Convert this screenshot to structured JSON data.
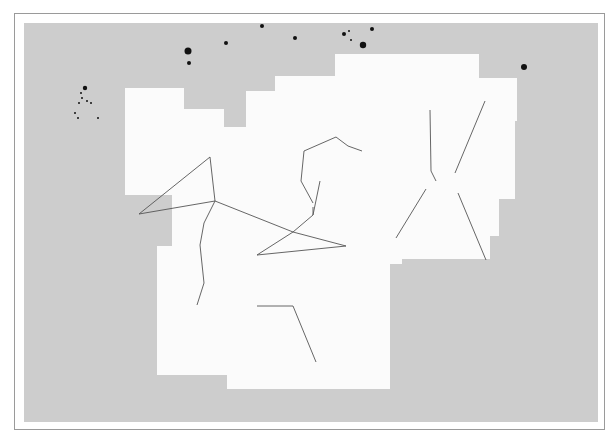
{
  "map": {
    "title": "Leo region star chart",
    "colors": {
      "outside": "#cdcdcd",
      "highlight": "#fbfbfb",
      "star": "#111111",
      "line": "#555555",
      "text": "#333333"
    },
    "constellation_labels": [
      {
        "name": "COMA BERENICES",
        "x": 16,
        "y": 52
      },
      {
        "name": "URSA MAJOR",
        "x": 131,
        "y": 52
      },
      {
        "name": "LEO MINOR",
        "x": 208,
        "y": 31
      },
      {
        "name": "GEMINI",
        "x": 538,
        "y": 67
      },
      {
        "name": "LEO",
        "x": 203,
        "y": 155
      },
      {
        "name": "CANCER",
        "x": 377,
        "y": 241
      },
      {
        "name": "VIRGO",
        "x": 51,
        "y": 252
      },
      {
        "name": "SEXTANS",
        "x": 222,
        "y": 263
      },
      {
        "name": "HYDRA",
        "x": 352,
        "y": 293
      },
      {
        "name": "CANIS MINOR",
        "x": 485,
        "y": 272
      },
      {
        "name": "MONOCEROS",
        "x": 518,
        "y": 321
      },
      {
        "name": "CRATER",
        "x": 108,
        "y": 378
      },
      {
        "name": "CANIS MAJOR",
        "x": 502,
        "y": 384
      }
    ],
    "named_objects": [
      {
        "name": "Regulus",
        "x": 302,
        "y": 209
      },
      {
        "name": "Praesepe",
        "x": 433,
        "y": 163
      },
      {
        "name": "Procyon",
        "x": 525,
        "y": 268
      },
      {
        "name": "M44",
        "x": 400,
        "y": 163
      },
      {
        "name": "M67",
        "x": 413,
        "y": 218
      },
      {
        "name": "M65",
        "x": 191,
        "y": 205
      },
      {
        "name": "M66",
        "x": 161,
        "y": 212
      },
      {
        "name": "M105",
        "x": 214,
        "y": 204
      },
      {
        "name": "M96",
        "x": 220,
        "y": 217
      },
      {
        "name": "M95",
        "x": 253,
        "y": 214
      },
      {
        "name": "R-leo",
        "label": "R",
        "x": 330,
        "y": 224
      },
      {
        "name": "R-cancer",
        "label": "R",
        "x": 474,
        "y": 228
      }
    ],
    "greek_labels": [
      {
        "t": "γ",
        "x": 87,
        "y": 89
      },
      {
        "t": "ο",
        "x": 219,
        "y": 44
      },
      {
        "t": "β",
        "x": 264,
        "y": 31
      },
      {
        "t": "α",
        "x": 369,
        "y": 48
      },
      {
        "t": "α",
        "x": 484,
        "y": 69
      },
      {
        "t": "β",
        "x": 515,
        "y": 100
      },
      {
        "t": "μ",
        "x": 325,
        "y": 107
      },
      {
        "t": "ε",
        "x": 361,
        "y": 121
      },
      {
        "t": "λ",
        "x": 376,
        "y": 130
      },
      {
        "t": "ι",
        "x": 426,
        "y": 92
      },
      {
        "t": "ϰ",
        "x": 462,
        "y": 102
      },
      {
        "t": "ζ",
        "x": 287,
        "y": 131
      },
      {
        "t": "ξ",
        "x": 385,
        "y": 145
      },
      {
        "t": "γ",
        "x": 424,
        "y": 145
      },
      {
        "t": "η",
        "x": 437,
        "y": 152
      },
      {
        "t": "δ",
        "x": 197,
        "y": 140
      },
      {
        "t": "γ",
        "x": 284,
        "y": 158
      },
      {
        "t": "η",
        "x": 298,
        "y": 182
      },
      {
        "t": "θ",
        "x": 197,
        "y": 183
      },
      {
        "t": "δ",
        "x": 404,
        "y": 172
      },
      {
        "t": "θ",
        "x": 439,
        "y": 175
      },
      {
        "t": "χ",
        "x": 396,
        "y": 182
      },
      {
        "t": "β",
        "x": 128,
        "y": 194
      },
      {
        "t": "α",
        "x": 296,
        "y": 224
      },
      {
        "t": "ο",
        "x": 342,
        "y": 228
      },
      {
        "t": "ϱ",
        "x": 247,
        "y": 238
      },
      {
        "t": "ι",
        "x": 183,
        "y": 226
      },
      {
        "t": "α",
        "x": 387,
        "y": 221
      },
      {
        "t": "β",
        "x": 474,
        "y": 240
      },
      {
        "t": "ε",
        "x": 10,
        "y": 221
      },
      {
        "t": "ο",
        "x": 122,
        "y": 239
      },
      {
        "t": "π",
        "x": 116,
        "y": 256
      },
      {
        "t": "ν",
        "x": 148,
        "y": 253
      },
      {
        "t": "σ",
        "x": 189,
        "y": 258
      },
      {
        "t": "τ",
        "x": 169,
        "y": 275
      },
      {
        "t": "ν",
        "x": 177,
        "y": 291
      },
      {
        "t": "δ",
        "x": 17,
        "y": 248
      },
      {
        "t": "β",
        "x": 145,
        "y": 293
      },
      {
        "t": "γ",
        "x": 38,
        "y": 313
      },
      {
        "t": "η",
        "x": 70,
        "y": 312
      },
      {
        "t": "ζ",
        "x": 391,
        "y": 265
      },
      {
        "t": "ε",
        "x": 418,
        "y": 262
      },
      {
        "t": "δ",
        "x": 431,
        "y": 267
      },
      {
        "t": "η",
        "x": 412,
        "y": 281
      },
      {
        "t": "σ",
        "x": 430,
        "y": 284
      },
      {
        "t": "θ",
        "x": 372,
        "y": 290
      },
      {
        "t": "β",
        "x": 515,
        "y": 248
      },
      {
        "t": "α",
        "x": 473,
        "y": 270
      },
      {
        "t": "ζ",
        "x": 455,
        "y": 296
      },
      {
        "t": "δ",
        "x": 564,
        "y": 314
      },
      {
        "t": "β",
        "x": 247,
        "y": 286
      },
      {
        "t": "α",
        "x": 300,
        "y": 283
      },
      {
        "t": "δ",
        "x": 245,
        "y": 303
      },
      {
        "t": "ε",
        "x": 258,
        "y": 341
      },
      {
        "t": "γ",
        "x": 296,
        "y": 341
      },
      {
        "t": "ι",
        "x": 311,
        "y": 283
      },
      {
        "t": "τ",
        "x": 328,
        "y": 285
      },
      {
        "t": "α",
        "x": 338,
        "y": 348
      },
      {
        "t": "θ",
        "x": 134,
        "y": 353
      },
      {
        "t": "ε",
        "x": 154,
        "y": 359
      },
      {
        "t": "δ",
        "x": 160,
        "y": 389
      },
      {
        "t": "λ",
        "x": 250,
        "y": 370
      }
    ]
  }
}
